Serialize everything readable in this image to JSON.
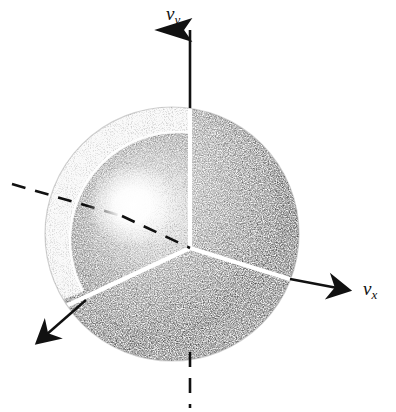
{
  "figure": {
    "background_color": "#ffffff",
    "ink_color": "#111111",
    "width": 396,
    "height": 412
  },
  "axes": [
    {
      "id": "vy",
      "symbol": "v",
      "subscript": "y",
      "label": "vy",
      "direction": "up",
      "style_outside": "solid",
      "style_negative": "dashed",
      "has_arrowhead": true,
      "arrow_tip": [
        191,
        24
      ]
    },
    {
      "id": "vx",
      "symbol": "v",
      "subscript": "x",
      "label": "vx",
      "direction": "right-down",
      "style_outside": "solid",
      "has_arrowhead": true,
      "arrow_tip": [
        355,
        292
      ]
    },
    {
      "id": "vz",
      "symbol": "v",
      "subscript": "z",
      "label": "",
      "direction": "lower-left",
      "style_outside": "solid",
      "has_arrowhead": true,
      "arrow_tip": [
        32,
        345
      ]
    },
    {
      "id": "vz-negative",
      "symbol": "v",
      "subscript": "z",
      "label": "",
      "direction": "upper-left",
      "style_outside": "dashed",
      "has_arrowhead": false,
      "arrow_tip": [
        12,
        184
      ]
    }
  ],
  "sphere": {
    "center": [
      172,
      234
    ],
    "radius": 127,
    "shell_thickness": 22,
    "render": "stipple",
    "cutaway_octant": "front-upper-left",
    "highlight_center": [
      133,
      205
    ],
    "highlight_radius": 44,
    "outer_edge_bounds": {
      "left": 43,
      "right": 298,
      "top": 110,
      "bottom": 357
    }
  },
  "origin": {
    "point": [
      190,
      248
    ],
    "junction": "three-way-white-Y"
  },
  "interior_lines": {
    "color": "#ffffff",
    "description": "white carved edges of the cut-away octant meeting at the origin"
  }
}
